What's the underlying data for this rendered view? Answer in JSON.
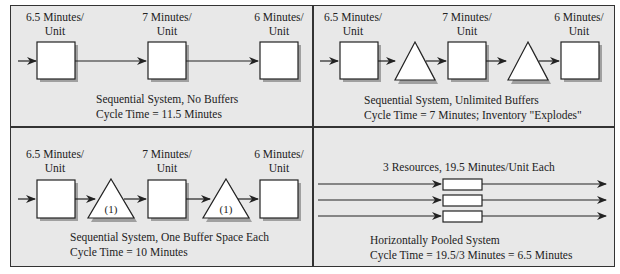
{
  "panels": [
    {
      "id": "top-left",
      "stations": [
        {
          "line1": "6.5 Minutes/",
          "line2": "Unit"
        },
        {
          "line1": "7 Minutes/",
          "line2": "Unit"
        },
        {
          "line1": "6 Minutes/",
          "line2": "Unit"
        }
      ],
      "caption1": "Sequential System, No Buffers",
      "caption2": "Cycle Time = 11.5 Minutes"
    },
    {
      "id": "top-right",
      "stations": [
        {
          "line1": "6.5 Minutes/",
          "line2": "Unit"
        },
        {
          "line1": "7 Minutes/",
          "line2": "Unit"
        },
        {
          "line1": "6 Minutes/",
          "line2": "Unit"
        }
      ],
      "caption1": "Sequential System, Unlimited Buffers",
      "caption2": "Cycle Time = 7 Minutes; Inventory \"Explodes\""
    },
    {
      "id": "bottom-left",
      "stations": [
        {
          "line1": "6.5 Minutes/",
          "line2": "Unit"
        },
        {
          "line1": "7 Minutes/",
          "line2": "Unit"
        },
        {
          "line1": "6 Minutes/",
          "line2": "Unit"
        }
      ],
      "buffer_label": "(1)",
      "caption1": "Sequential System, One Buffer Space Each",
      "caption2": "Cycle Time = 10 Minutes"
    },
    {
      "id": "bottom-right",
      "header": "3 Resources, 19.5 Minutes/Unit Each",
      "caption1": "Horizontally Pooled System",
      "caption2": "Cycle Time = 19.5/3 Minutes = 6.5 Minutes"
    }
  ],
  "colors": {
    "panel_bg": "#e8e8e8",
    "line": "#222222",
    "shape_fill": "#ffffff",
    "shadow": "#a0a0a0"
  }
}
